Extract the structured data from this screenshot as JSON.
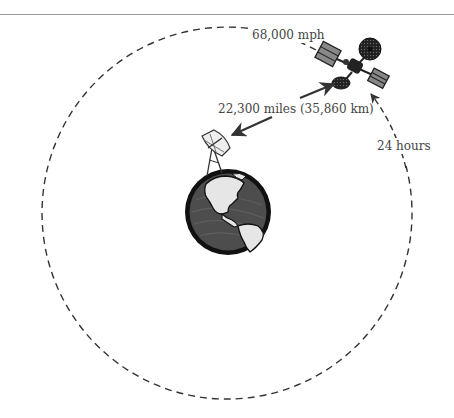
{
  "diagram": {
    "labels": {
      "speed": "68,000 mph",
      "distance": "22,300 miles (35,860 km)",
      "period": "24 hours"
    },
    "elements": {
      "orbit": "dashed circular orbit",
      "satellite": "communications satellite",
      "ground_station": "satellite dish antenna",
      "planet": "Earth (Americas view)"
    },
    "colors": {
      "line": "#333333",
      "text": "#444444",
      "ocean": "#4a4a4a",
      "land": "#e6e6e6",
      "outline": "#111111",
      "rule": "#999999"
    }
  }
}
